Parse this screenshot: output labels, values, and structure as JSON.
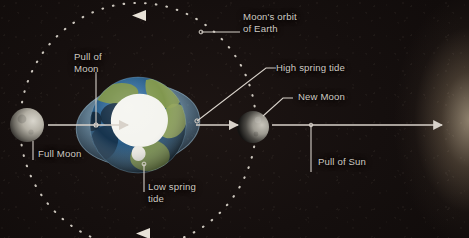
{
  "figure": {
    "background_color": "#181110",
    "label_color": "#cfc9c2",
    "line_color": "#d8d2ca"
  },
  "labels": {
    "moons_orbit": "Moon's orbit\nof Earth",
    "high_spring_tide": "High spring tide",
    "new_moon": "New Moon",
    "pull_of_sun": "Pull of Sun",
    "pull_of_moon": "Pull of\nMoon",
    "full_moon": "Full Moon",
    "low_spring_tide": "Low spring\ntide"
  },
  "bodies": {
    "earth": {
      "name": "Earth",
      "center_x": 138,
      "center_y": 125,
      "radius": 48,
      "view": "south-polar",
      "ocean_color": "#2e6ea8",
      "land_color": "#6f8c3e",
      "ice_color": "#f4f4ef"
    },
    "tidal_bulge": {
      "name": "Tidal bulge envelope",
      "center_x": 138,
      "center_y": 125,
      "radius_x": 62,
      "radius_y": 40,
      "rotation_deg": -7,
      "color": "#8fc0e0"
    },
    "full_moon": {
      "name": "Full Moon",
      "center_x": 27,
      "center_y": 125,
      "radius": 17,
      "lit_side": "right"
    },
    "new_moon": {
      "name": "New Moon",
      "center_x": 253,
      "center_y": 127,
      "radius": 16,
      "lit_side": "right"
    },
    "sun_glow": {
      "name": "Sun",
      "edge": "right",
      "color": "#f5e1be"
    }
  },
  "orbit": {
    "name": "Moon's orbit of Earth",
    "center_x": 138,
    "center_y": 125,
    "radius_x": 118,
    "radius_y": 122,
    "style": "dotted",
    "dot_count": 62,
    "direction_markers": [
      "top-left-pointing",
      "bottom-left-pointing"
    ]
  },
  "force_arrows": [
    {
      "name": "pull-of-moon-arrow",
      "label": "Pull of Moon",
      "from_x": 128,
      "to_x": 48,
      "y": 125,
      "direction": "left"
    },
    {
      "name": "pull-of-sun-arrow",
      "label": "Pull of Sun",
      "from_x": 196,
      "to_x": 440,
      "y": 125,
      "direction": "right"
    }
  ]
}
